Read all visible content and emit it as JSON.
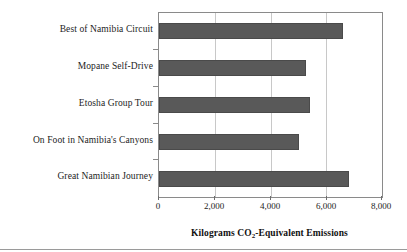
{
  "chart_data": {
    "type": "bar",
    "orientation": "horizontal",
    "title": "",
    "subtitle": "",
    "xlabel": "Kilograms CO2-Equivalent Emissions",
    "xlabel_parts": {
      "before": "Kilograms CO",
      "sub": "2",
      "after": "-Equivalent Emissions"
    },
    "ylabel": "",
    "categories": [
      "Best of Namibia Circuit",
      "Mopane Self-Drive",
      "Etosha Group Tour",
      "On Foot in Namibia's Canyons",
      "Great Namibian Journey"
    ],
    "values": [
      6600,
      5270,
      5420,
      5020,
      6820
    ],
    "xlim": [
      0,
      8000
    ],
    "xticks": [
      0,
      2000,
      4000,
      6000,
      8000
    ],
    "xtick_labels": [
      "0",
      "2,000",
      "4,000",
      "6,000",
      "8,000"
    ],
    "grid": "vertical",
    "legend": "none",
    "bar_color": "#595959",
    "bar_border_color": "#4a4a4a",
    "gridline_color": "#c8c8c8",
    "frame_color": "#8a8a8a",
    "text_color": "#1c1c1c"
  }
}
